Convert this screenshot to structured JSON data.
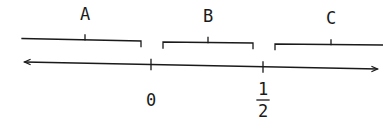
{
  "diagram": {
    "type": "number-line",
    "intervals": [
      {
        "label": "A",
        "description": "interval to the left of 0"
      },
      {
        "label": "B",
        "description": "interval between 0 and 1/2"
      },
      {
        "label": "C",
        "description": "interval to the right of 1/2"
      }
    ],
    "ticks": [
      {
        "label": "0"
      },
      {
        "label_numerator": "1",
        "label_denominator": "2"
      }
    ],
    "colors": {
      "ink": "#1a1a1a",
      "background": "#ffffff"
    }
  }
}
